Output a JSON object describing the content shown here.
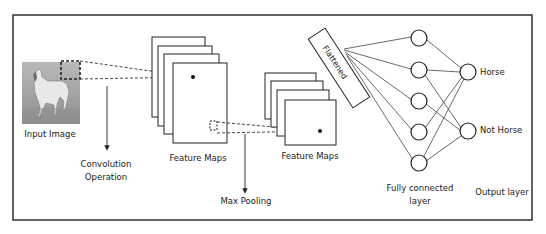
{
  "diagram": {
    "labels": {
      "input_image": "Input Image",
      "convolution_line1": "Convolution",
      "convolution_line2": "Operation",
      "feature_maps_1": "Feature Maps",
      "feature_maps_2": "Feature Maps",
      "max_pooling": "Max Pooling",
      "flattened": "Flattened",
      "fully_connected_line1": "Fully connected",
      "fully_connected_line2": "layer",
      "output_layer": "Output layer",
      "output_horse": "Horse",
      "output_not_horse": "Not Horse"
    },
    "colors": {
      "stroke": "#222222",
      "background": "#ffffff",
      "image_tint": "#9a9a9a"
    },
    "fully_connected_nodes": 5,
    "output_nodes": 2
  }
}
